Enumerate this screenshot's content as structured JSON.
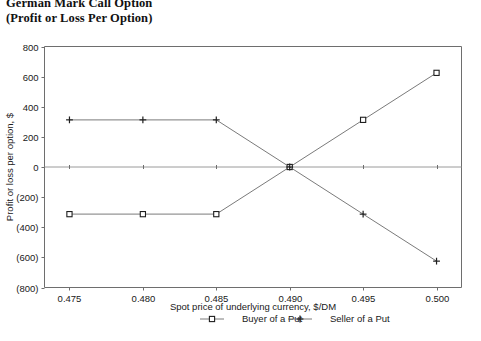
{
  "title": {
    "line1": "German Mark Call Option",
    "line2": "(Profit or Loss Per Option)"
  },
  "chart_data": {
    "type": "line",
    "title": "German Mark Call Option (Profit or Loss Per Option)",
    "xlabel": "Spot price of underlying currency, $/DM",
    "ylabel": "Profit or loss per option, $",
    "x": [
      0.475,
      0.48,
      0.485,
      0.49,
      0.495,
      0.5
    ],
    "xtick_labels": [
      "0.475",
      "0.480",
      "0.485",
      "0.490",
      "0.495",
      "0.500"
    ],
    "xlim": [
      0.4733,
      0.5017
    ],
    "ylim": [
      -800,
      800
    ],
    "ytick_values": [
      800,
      600,
      400,
      200,
      0,
      -200,
      -400,
      -600,
      -800
    ],
    "ytick_labels": [
      "800",
      "600",
      "400",
      "200",
      "0",
      "(200)",
      "(400)",
      "(600)",
      "(800)"
    ],
    "grid": false,
    "legend_position": "bottom",
    "series": [
      {
        "name": "Buyer of a Put",
        "marker": "square",
        "values": [
          -313,
          -313,
          -313,
          0,
          313,
          625
        ]
      },
      {
        "name": "Seller of a Put",
        "marker": "plus",
        "values": [
          313,
          313,
          313,
          0,
          -313,
          -625
        ]
      }
    ]
  },
  "legend": {
    "items": [
      {
        "label": "Buyer of a Put",
        "marker": "square"
      },
      {
        "label": "Seller of a Put",
        "marker": "plus"
      }
    ]
  },
  "axes": {
    "x_title": "Spot price of underlying currency, $/DM",
    "y_title": "Profit or loss per option, $",
    "x_ticks": [
      "0.475",
      "0.480",
      "0.485",
      "0.490",
      "0.495",
      "0.500"
    ],
    "y_ticks": [
      "800",
      "600",
      "400",
      "200",
      "0",
      "(200)",
      "(400)",
      "(600)",
      "(800)"
    ]
  }
}
